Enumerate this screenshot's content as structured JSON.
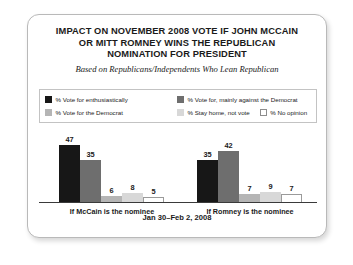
{
  "card": {
    "title_lines": [
      "IMPACT ON NOVEMBER 2008 VOTE IF JOHN MCCAIN",
      "OR MITT ROMNEY WINS THE REPUBLICAN",
      "NOMINATION FOR PRESIDENT"
    ],
    "subtitle": "Based on Republicans/Independents Who Lean Republican",
    "footer_date": "Jan 30–Feb 2, 2008"
  },
  "legend": {
    "items": [
      {
        "label": "% Vote for enthusiastically",
        "color": "#171717"
      },
      {
        "label": "% Vote for, mainly against the Democrat",
        "color": "#6e6e6e"
      },
      {
        "label": "% Vote for the Democrat",
        "color": "#b5b5b5"
      },
      {
        "label": "% Stay home, not vote",
        "color": "#d8d8d8"
      },
      {
        "label": "% No opinion",
        "color": "#ffffff"
      }
    ]
  },
  "chart_data": {
    "type": "bar",
    "title": "IMPACT ON NOVEMBER 2008 VOTE IF JOHN MCCAIN OR MITT ROMNEY WINS THE REPUBLICAN NOMINATION FOR PRESIDENT",
    "subtitle": "Based on Republicans/Independents Who Lean Republican",
    "xlabel": "",
    "ylabel": "",
    "ylim": [
      0,
      50
    ],
    "grid": false,
    "legend_position": "top",
    "categories": [
      "If McCain is the nominee",
      "If Romney is the nominee"
    ],
    "series": [
      {
        "name": "% Vote for enthusiastically",
        "color": "#171717",
        "values": [
          47,
          35
        ]
      },
      {
        "name": "% Vote for, mainly against the Democrat",
        "color": "#6e6e6e",
        "values": [
          35,
          42
        ]
      },
      {
        "name": "% Vote for the Democrat",
        "color": "#b5b5b5",
        "values": [
          6,
          7
        ]
      },
      {
        "name": "% Stay home, not vote",
        "color": "#d8d8d8",
        "values": [
          8,
          9
        ]
      },
      {
        "name": "% No opinion",
        "color": "#ffffff",
        "values": [
          5,
          7
        ]
      }
    ],
    "annotation": "Jan 30–Feb 2, 2008"
  }
}
